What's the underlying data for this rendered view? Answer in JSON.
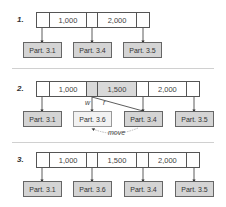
{
  "steps": [
    {
      "label": "1.",
      "keys": [
        "1,000",
        "2,000"
      ],
      "partitions": [
        "Part. 3.1",
        "Part. 3.4",
        "Part. 3.5"
      ]
    },
    {
      "label": "2.",
      "keys": [
        "1,000",
        "1,500",
        "2,000"
      ],
      "partitions": [
        "Part. 3.1",
        "Part. 3.6",
        "Part. 3.4",
        "Part. 3.5"
      ],
      "annotations": {
        "write": "w",
        "read": "r",
        "move": "move"
      }
    },
    {
      "label": "3.",
      "keys": [
        "1,000",
        "1,500",
        "2,000"
      ],
      "partitions": [
        "Part. 3.1",
        "Part. 3.6",
        "Part. 3.4",
        "Part. 3.5"
      ]
    }
  ],
  "colors": {
    "partition_fill": "#d4d4d4",
    "new_partition_fill": "#f2f2f2",
    "highlight_cell": "#d9d9d9"
  }
}
